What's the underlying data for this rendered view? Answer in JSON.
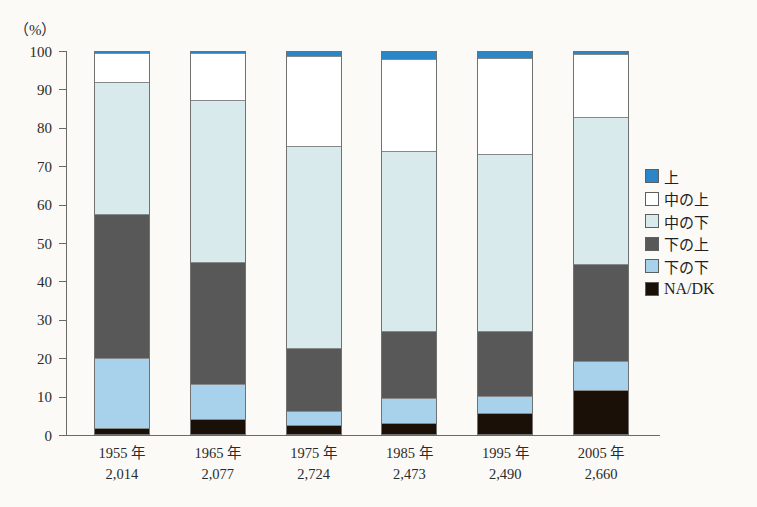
{
  "chart_data": {
    "type": "bar",
    "title": "",
    "subtitle": "",
    "stacked": true,
    "stack_total": 100,
    "xlabel": "",
    "ylabel": "(%)",
    "ylim": [
      0,
      100
    ],
    "yticks": [
      0,
      10,
      20,
      30,
      40,
      50,
      60,
      70,
      80,
      90,
      100
    ],
    "ytick_labels": [
      "0",
      "10",
      "20",
      "30",
      "40",
      "50",
      "60",
      "70",
      "80",
      "90",
      "100"
    ],
    "grid": false,
    "legend_position": "right",
    "categories": [
      "1955 年",
      "1965 年",
      "1975 年",
      "1985 年",
      "1995 年",
      "2005 年"
    ],
    "category_sublabels": [
      "2,014",
      "2,077",
      "2,724",
      "2,473",
      "2,490",
      "2,660"
    ],
    "series": [
      {
        "name": "上",
        "color": "#2b86c8",
        "values": [
          0.3,
          0.3,
          1.0,
          1.8,
          1.5,
          0.6
        ]
      },
      {
        "name": "中の上",
        "color": "#ffffff",
        "values": [
          7.5,
          12.2,
          23.5,
          24.0,
          25.2,
          16.4
        ]
      },
      {
        "name": "中の下",
        "color": "#d8eaec",
        "values": [
          34.5,
          42.5,
          53.0,
          47.2,
          46.3,
          38.5
        ]
      },
      {
        "name": "下の上",
        "color": "#585858",
        "values": [
          37.7,
          32.0,
          16.5,
          17.7,
          17.0,
          25.5
        ]
      },
      {
        "name": "下の下",
        "color": "#a8d2ec",
        "values": [
          18.5,
          9.2,
          3.7,
          6.3,
          4.5,
          7.5
        ]
      },
      {
        "name": "NA/DK",
        "color": "#1a1008",
        "values": [
          1.5,
          3.8,
          2.3,
          3.0,
          5.5,
          11.5
        ]
      }
    ],
    "stack_order_top_to_bottom": [
      "上",
      "中の上",
      "中の下",
      "下の上",
      "下の下",
      "NA/DK"
    ],
    "cumulative_tops": [
      {
        "category": "1955 年",
        "上": 100.0,
        "中の上": 99.7,
        "中の下": 92.2,
        "下の上": 57.7,
        "下の下": 20.0,
        "NA/DK": 1.5
      },
      {
        "category": "1965 年",
        "上": 100.0,
        "中の上": 99.7,
        "中の下": 87.5,
        "下の上": 45.0,
        "下の下": 13.0,
        "NA/DK": 3.8
      },
      {
        "category": "1975 年",
        "上": 100.0,
        "中の上": 99.0,
        "中の下": 75.5,
        "下の上": 22.5,
        "下の下": 6.0,
        "NA/DK": 2.3
      },
      {
        "category": "1985 年",
        "上": 100.0,
        "中の上": 98.2,
        "中の下": 74.2,
        "下の上": 27.0,
        "下の下": 9.3,
        "NA/DK": 3.0
      },
      {
        "category": "1995 年",
        "上": 100.0,
        "中の上": 98.5,
        "中の下": 73.3,
        "下の上": 27.0,
        "下の下": 10.0,
        "NA/DK": 5.5
      },
      {
        "category": "2005 年",
        "上": 100.0,
        "中の上": 99.4,
        "中の下": 83.0,
        "下の上": 44.5,
        "下の下": 19.0,
        "NA/DK": 11.5
      }
    ]
  },
  "legend": {
    "items": [
      {
        "label": "上",
        "color": "#2b86c8",
        "latin": false
      },
      {
        "label": "中の上",
        "color": "#ffffff",
        "latin": false
      },
      {
        "label": "中の下",
        "color": "#d8eaec",
        "latin": false
      },
      {
        "label": "下の上",
        "color": "#585858",
        "latin": false
      },
      {
        "label": "下の下",
        "color": "#a8d2ec",
        "latin": false
      },
      {
        "label": "NA/DK",
        "color": "#1a1008",
        "latin": true
      }
    ]
  },
  "axis": {
    "unit": "（%）"
  }
}
